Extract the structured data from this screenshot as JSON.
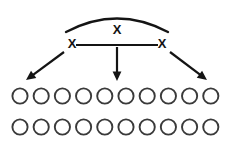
{
  "diagram": {
    "background_color": "#ffffff",
    "ink_color": "#141414",
    "circle_stroke_color": "#3a3a3a",
    "arc": {
      "label": "X",
      "label_x": 117,
      "label_y": 31,
      "start_x": 66,
      "start_y": 32,
      "peak_x": 117,
      "peak_y": 12,
      "end_x": 168,
      "end_y": 32
    },
    "connector": {
      "from_x": 76,
      "to_x": 158,
      "y": 45
    },
    "nodes": [
      {
        "id": "left-node",
        "label": "X",
        "x": 72,
        "y": 45
      },
      {
        "id": "right-node",
        "label": "X",
        "x": 162,
        "y": 45
      }
    ],
    "arrows": [
      {
        "id": "arrow-left",
        "direction": "down-left",
        "x1": 64,
        "y1": 52,
        "x2": 26,
        "y2": 80
      },
      {
        "id": "arrow-middle",
        "direction": "down",
        "x1": 117,
        "y1": 47,
        "x2": 117,
        "y2": 81
      },
      {
        "id": "arrow-right",
        "direction": "down-right",
        "x1": 170,
        "y1": 52,
        "x2": 207,
        "y2": 80
      }
    ],
    "circle_rows": [
      {
        "id": "row-top",
        "count": 10,
        "cy": 96,
        "start_x": 20,
        "spacing": 21.2,
        "radius": 7.6
      },
      {
        "id": "row-bottom",
        "count": 10,
        "cy": 127,
        "start_x": 20,
        "spacing": 21.2,
        "radius": 7.6
      }
    ]
  }
}
